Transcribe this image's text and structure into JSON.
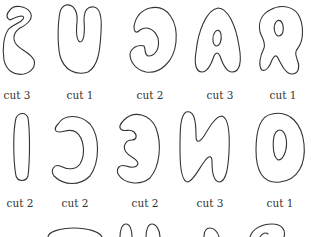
{
  "rows": [
    {
      "pieces": [
        {
          "glyph": "S",
          "label": "cut 3",
          "x": 17
        },
        {
          "glyph": "U",
          "label": "cut 1",
          "x": 80
        },
        {
          "glyph": "G",
          "label": "cut 2",
          "x": 150
        },
        {
          "glyph": "A",
          "label": "cut 3",
          "x": 220
        },
        {
          "glyph": "R",
          "label": "cut 1",
          "x": 283
        }
      ]
    },
    {
      "pieces": [
        {
          "glyph": "I",
          "label": "cut 2",
          "x": 20
        },
        {
          "glyph": "C",
          "label": "cut 2",
          "x": 75
        },
        {
          "glyph": "E",
          "label": "cut 2",
          "x": 145
        },
        {
          "glyph": "N",
          "label": "cut 3",
          "x": 210
        },
        {
          "glyph": "O",
          "label": "cut 1",
          "x": 280
        }
      ]
    },
    {
      "pieces": [
        {
          "glyph": "partial-1"
        },
        {
          "glyph": "partial-2"
        },
        {
          "glyph": "partial-3"
        },
        {
          "glyph": "partial-4"
        }
      ]
    }
  ],
  "colors": {
    "stroke": "#333333",
    "text": "#333333",
    "background": "#ffffff"
  }
}
